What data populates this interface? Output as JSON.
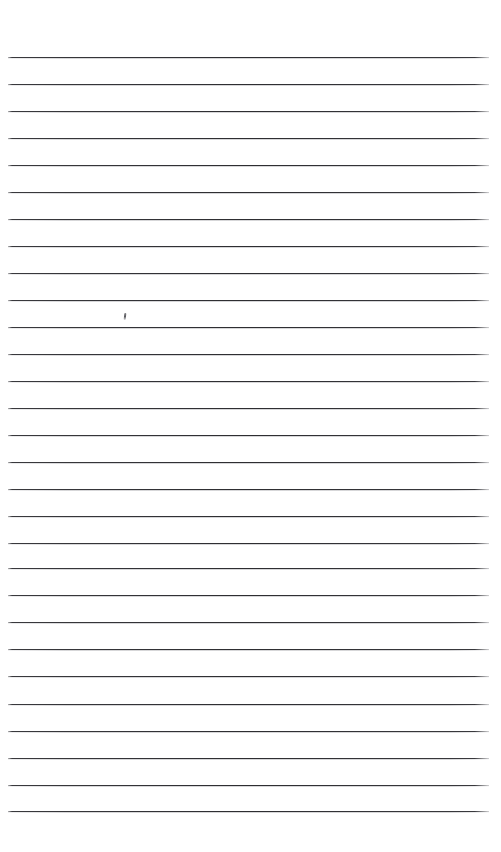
{
  "document": {
    "title": "Blank ruled paper scan",
    "kind": "lined-notebook-page",
    "background_color": "#ffffff",
    "rule_color": "#28282c",
    "page_width": 501,
    "page_height": 852,
    "text_content": ""
  },
  "ruling": {
    "line_count": 29,
    "line_left": 8,
    "line_right": 489,
    "line_thickness": 1,
    "first_line_y": 57,
    "spacing": 26.9,
    "line_y_positions": [
      57,
      84,
      111,
      138,
      165,
      192,
      219,
      246,
      273,
      300,
      327,
      354,
      381,
      408,
      435,
      462,
      489,
      516,
      543,
      568,
      595,
      622,
      649,
      676,
      704,
      731,
      758,
      785,
      811
    ]
  },
  "marks": [
    {
      "name": "pencil-tick",
      "x": 124,
      "y": 313,
      "width": 2,
      "height": 7,
      "color": "#4a4a50"
    }
  ],
  "margins": {
    "top": 57,
    "bottom": 41,
    "left": 8,
    "right": 12
  }
}
